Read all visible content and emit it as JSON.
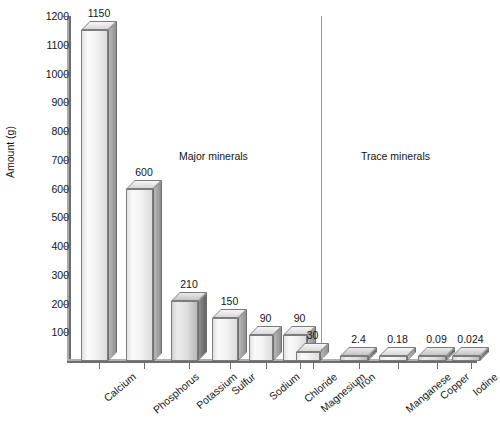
{
  "chart_data": {
    "type": "bar",
    "title": "",
    "xlabel": "",
    "ylabel": "Amount (g)",
    "ylim": [
      0,
      1200
    ],
    "ytick_step": 100,
    "grid": false,
    "legend": null,
    "categories": [
      "Calcium",
      "Phosphorus",
      "Potassium",
      "Sulfur",
      "Sodium",
      "Chloride",
      "Magnesium",
      "Iron",
      "Manganese",
      "Copper",
      "Iodine"
    ],
    "values": [
      1150,
      600,
      210,
      150,
      90,
      90,
      30,
      2.4,
      0.18,
      0.09,
      0.024
    ],
    "value_labels": [
      "1150",
      "600",
      "210",
      "150",
      "90",
      "90",
      "90",
      "30",
      "2.4",
      "0.18",
      "0.09",
      "0.024"
    ],
    "ytick_labels": [
      "1200",
      "1100",
      "1000",
      "900",
      "800",
      "700",
      "600",
      "500",
      "400",
      "300",
      "200",
      "100"
    ],
    "annotations": [
      {
        "text": "Major minerals",
        "group": "major"
      },
      {
        "text": "Trace minerals",
        "group": "trace"
      }
    ],
    "groups": {
      "major": [
        "Calcium",
        "Phosphorus",
        "Potassium",
        "Sulfur",
        "Sodium",
        "Chloride",
        "Magnesium"
      ],
      "trace": [
        "Iron",
        "Manganese",
        "Copper",
        "Iodine"
      ]
    }
  },
  "axis": {
    "y_title": "Amount (g)",
    "y_ticks": [
      "1200",
      "1100",
      "1000",
      "900",
      "800",
      "700",
      "600",
      "500",
      "400",
      "300",
      "200",
      "100"
    ]
  },
  "bars": [
    {
      "label": "Calcium",
      "value_label": "1150"
    },
    {
      "label": "Phosphorus",
      "value_label": "600"
    },
    {
      "label": "Potassium",
      "value_label": "210"
    },
    {
      "label": "Sulfur",
      "value_label": "150"
    },
    {
      "label": "Sodium",
      "value_label": "90"
    },
    {
      "label": "Chloride",
      "value_label": "90"
    },
    {
      "label": "Magnesium",
      "value_label": "30"
    },
    {
      "label": "Iron",
      "value_label": "2.4"
    },
    {
      "label": "Manganese",
      "value_label": "0.18"
    },
    {
      "label": "Copper",
      "value_label": "0.09"
    },
    {
      "label": "Iodine",
      "value_label": "0.024"
    }
  ],
  "sections": {
    "major_label": "Major minerals",
    "trace_label": "Trace minerals"
  },
  "colors": {
    "bar_front_light": "#f0f0f0",
    "bar_front_dark": "#d0d0d0",
    "bar_side": "#9a9a9a",
    "bar_top": "#e6e6e6",
    "axis": "#6d6d6d",
    "text": "#141414",
    "background": "#ffffff"
  }
}
